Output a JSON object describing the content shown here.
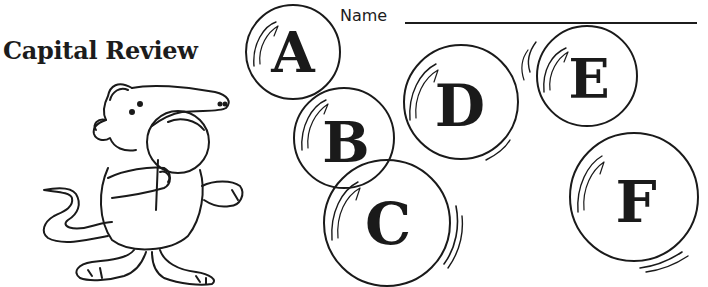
{
  "worksheet": {
    "title": "Capital Review",
    "name_label": "Name",
    "name_field_value": ""
  },
  "bubbles": [
    {
      "letter": "A"
    },
    {
      "letter": "B"
    },
    {
      "letter": "C"
    },
    {
      "letter": "D"
    },
    {
      "letter": "E"
    },
    {
      "letter": "F"
    }
  ],
  "illustration": {
    "subject": "cartoon anteater holding a bubble wand"
  },
  "colors": {
    "ink": "#1a1a1a",
    "paper": "#ffffff"
  }
}
